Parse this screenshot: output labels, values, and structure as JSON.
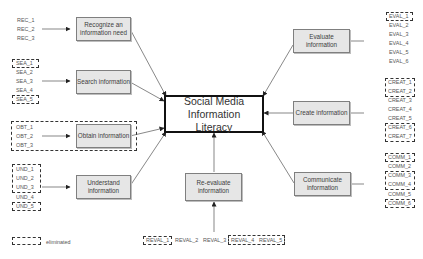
{
  "title": "Social Media Information Literacy",
  "nodes": {
    "recognize": "Recognize an information need",
    "search": "Search information",
    "obtain": "Obtain information",
    "understand": "Understand information",
    "reevaluate": "Re-evaluate information",
    "evaluate": "Evaluate information",
    "create": "Create information",
    "communicate": "Communicate information"
  },
  "codes": {
    "rec": [
      "REC_1",
      "REC_2",
      "REC_3"
    ],
    "sea": [
      "SEA_1",
      "SEA_2",
      "SEA_3",
      "SEA_4",
      "SEA_5"
    ],
    "obt": [
      "OBT_1",
      "OBT_2",
      "OBT_3"
    ],
    "und": [
      "UND_1",
      "UND_2",
      "UND_3",
      "UND_4",
      "UND_5"
    ],
    "reval": [
      "REVAL_1",
      "REVAL_2",
      "REVAL_3",
      "REVAL_4",
      "REVAL_5"
    ],
    "eval": [
      "EVAL_1",
      "EVAL_2",
      "EVAL_3",
      "EVAL_4",
      "EVAL_5",
      "EVAL_6"
    ],
    "creat": [
      "CREAT_1",
      "CREAT_2",
      "CREAT_3",
      "CREAT_4",
      "CREAT_5",
      "CREAT_6",
      "CREAT_7"
    ],
    "comm": [
      "COMM_1",
      "COMM_2",
      "COMM_3",
      "COMM_4",
      "COMM_5",
      "COMM_6"
    ]
  },
  "eliminated": [
    "SEA_1",
    "SEA_5",
    "OBT_1",
    "OBT_2",
    "OBT_3",
    "UND_1",
    "UND_2",
    "UND_3",
    "UND_5",
    "REVAL_1",
    "REVAL_4",
    "REVAL_5",
    "EVAL_1",
    "CREAT_1",
    "CREAT_2",
    "CREAT_6",
    "CREAT_7",
    "COMM_1",
    "COMM_3",
    "COMM_4",
    "COMM_6"
  ],
  "legend": {
    "label": "eliminated"
  },
  "colors": {
    "node_fill": "#e6e6e6",
    "node_border": "#7f7f7f",
    "center_border": "#111111",
    "arrow": "#333333"
  }
}
